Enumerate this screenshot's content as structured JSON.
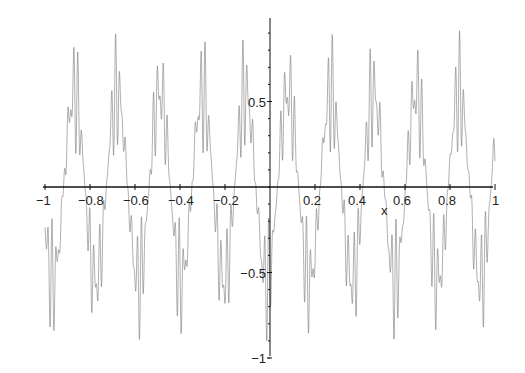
{
  "chart_data": {
    "type": "line",
    "title": "",
    "xlabel": "x",
    "ylabel": "",
    "xlim": [
      -1,
      1
    ],
    "ylim": [
      -1,
      1
    ],
    "grid": false,
    "legend": null,
    "x_ticks": [
      -1,
      -0.8,
      -0.6,
      -0.4,
      -0.2,
      0.2,
      0.4,
      0.6,
      0.8,
      1
    ],
    "x_tick_labels": [
      "−1",
      "−0.8",
      "−0.6",
      "−0.4",
      "−0.2",
      "0.2",
      "0.4",
      "0.6",
      "0.8",
      "1"
    ],
    "y_ticks": [
      0.5,
      -0.5,
      -1
    ],
    "y_tick_labels": [
      "0.5",
      "−0.5",
      "−1"
    ],
    "series": [
      {
        "name": "f(x)",
        "description": "high-frequency oscillation modulated by a slower envelope (~10.5 lobes over [-1,1]), amplitude ≈ 0.9",
        "envelope_period": 0.19,
        "amplitude": 0.92,
        "carrier_frequency": 300,
        "color": "#7a7a7a"
      }
    ]
  },
  "axes": {
    "x_axis_label": "x",
    "origin_px": {
      "x": 270,
      "y": 187
    },
    "x_scale_px_per_unit": 225,
    "y_scale_px_per_unit": 171
  }
}
